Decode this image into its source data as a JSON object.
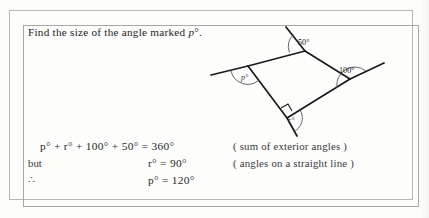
{
  "question": {
    "prefix": "Find the size of the angle marked ",
    "variable": "p",
    "suffix": "°."
  },
  "diagram": {
    "type": "quadrilateral-exterior-angles",
    "angle_labels": {
      "top": "50°",
      "right": "100°",
      "left": "p°",
      "bottom": "r°"
    },
    "right_angle_marker": true,
    "stroke_color": "#1a1a1a",
    "arc_color": "#4a4a4a"
  },
  "solution": {
    "rows": [
      {
        "lead": "",
        "equation": "p° + r° + 100° + 50° = 360°",
        "reason": "( sum of exterior angles )"
      },
      {
        "lead": "but",
        "equation": "r° = 90°",
        "reason": "( angles on a straight line )"
      },
      {
        "lead": "∴",
        "equation": "p° = 120°",
        "reason": ""
      }
    ]
  }
}
